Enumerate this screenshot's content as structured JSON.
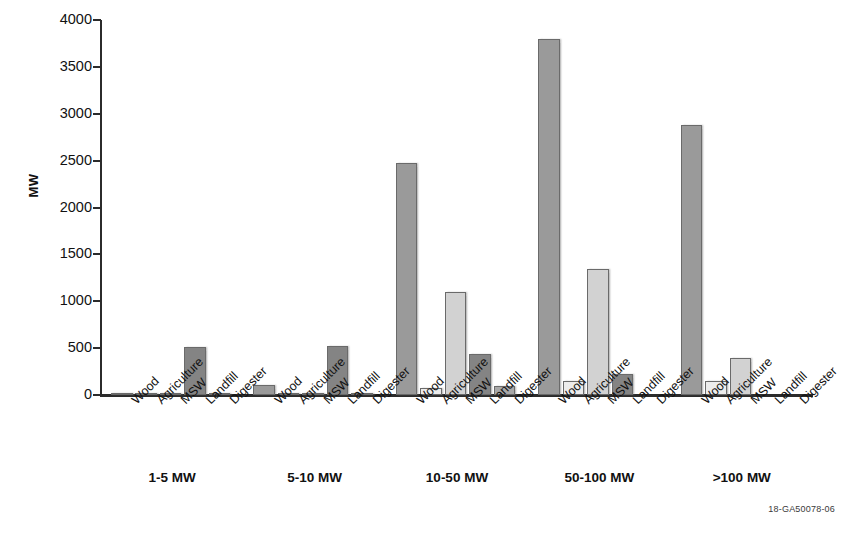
{
  "figure": {
    "id_text": "18-GA50078-06"
  },
  "chart_data": {
    "type": "bar",
    "title": "",
    "xlabel": "",
    "ylabel": "MW",
    "ylim": [
      0,
      4000
    ],
    "yticks": [
      0,
      500,
      1000,
      1500,
      2000,
      2500,
      3000,
      3500,
      4000
    ],
    "ytick_labels": [
      "0",
      "500",
      "1000",
      "1500",
      "2000",
      "2500",
      "3000",
      "3500",
      "4000"
    ],
    "grid": false,
    "legend": "none",
    "categories": [
      "1-5 MW",
      "5-10 MW",
      "10-50 MW",
      "50-100 MW",
      ">100 MW"
    ],
    "series_names": [
      "Wood",
      "Agriculture",
      "MSW",
      "Landfill",
      "Digester"
    ],
    "series_colors": [
      "#9a9a9a",
      "#ececec",
      "#d2d2d2",
      "#848484",
      "#a8a8a8"
    ],
    "series": [
      {
        "name": "Wood",
        "color": "#9a9a9a",
        "values": [
          10,
          105,
          2480,
          3800,
          2875
        ]
      },
      {
        "name": "Agriculture",
        "color": "#ececec",
        "values": [
          5,
          8,
          75,
          145,
          150
        ]
      },
      {
        "name": "MSW",
        "color": "#d2d2d2",
        "values": [
          5,
          20,
          1100,
          1345,
          390
        ]
      },
      {
        "name": "Landfill",
        "color": "#848484",
        "values": [
          510,
          520,
          440,
          225,
          0
        ]
      },
      {
        "name": "Digester",
        "color": "#a8a8a8",
        "values": [
          10,
          8,
          100,
          0,
          0
        ]
      }
    ],
    "group_tick_labels": [
      [
        "Wood",
        "Agriculture",
        "MSW",
        "Landfill",
        "Digester"
      ],
      [
        "Wood",
        "Agriculture",
        "MSW",
        "Landfill",
        "Digester"
      ],
      [
        "Wood",
        "Agriculture",
        "MSW",
        "Landfill",
        "Digester"
      ],
      [
        "Wood",
        "Agriculture",
        "MSW",
        "Landfill",
        "Digester"
      ],
      [
        "Wood",
        "Agriculture",
        "MSW",
        "Landfill",
        "Digester"
      ]
    ]
  }
}
